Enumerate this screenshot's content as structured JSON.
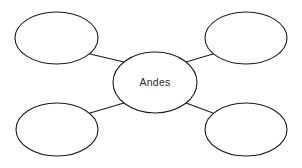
{
  "canvas": {
    "width": 302,
    "height": 168,
    "background_color": "#ffffff",
    "stroke_color": "#1a1a1a",
    "text_color": "#2b2b2b"
  },
  "diagram": {
    "type": "concept-map",
    "center_node": {
      "id": "center",
      "label": "Andes",
      "cx": 155,
      "cy": 82.5,
      "rx": 42,
      "ry": 30.5
    },
    "outer_nodes": [
      {
        "id": "top-left",
        "label": "",
        "cx": 56.5,
        "cy": 38,
        "rx": 41.5,
        "ry": 26
      },
      {
        "id": "top-right",
        "label": "",
        "cx": 246,
        "cy": 38,
        "rx": 41,
        "ry": 26
      },
      {
        "id": "bottom-left",
        "label": "",
        "cx": 57,
        "cy": 129.5,
        "rx": 41,
        "ry": 26.5
      },
      {
        "id": "bottom-right",
        "label": "",
        "cx": 246,
        "cy": 129.5,
        "rx": 41,
        "ry": 26.5
      }
    ],
    "connectors": [
      {
        "id": "center-to-top-left",
        "x1": 124,
        "y1": 62,
        "x2": 90,
        "y2": 54
      },
      {
        "id": "center-to-top-right",
        "x1": 186,
        "y1": 62,
        "x2": 213,
        "y2": 54
      },
      {
        "id": "center-to-bottom-left",
        "x1": 124,
        "y1": 103,
        "x2": 90,
        "y2": 113
      },
      {
        "id": "center-to-bottom-right",
        "x1": 186,
        "y1": 103,
        "x2": 213,
        "y2": 113
      }
    ]
  }
}
